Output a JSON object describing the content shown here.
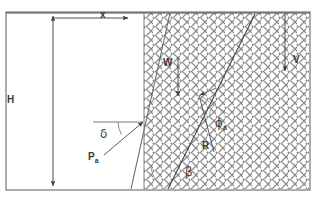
{
  "figure": {
    "width": 316,
    "height": 202,
    "background_color": "#ffffff",
    "line_color": "#4a4a4a",
    "soil_hatch_color": "#8d8d8d",
    "label_color": "#3a3a3a"
  },
  "labels": {
    "x": "x",
    "H": "H",
    "W": "W",
    "V": "V",
    "R": "R",
    "beta": "β",
    "delta": "δ",
    "phi": "ϕ",
    "phi_sub": "a",
    "Pa": "P",
    "Pa_sub": "a"
  },
  "elements": {
    "top_ground_surface": "top-ground-line",
    "wall_face": "inclined-wall-face",
    "failure_plane": "failure-wedge-plane",
    "soil_region": "hatched-backfill-soil",
    "height_dimension": "H-dimension-arrow",
    "x_dimension": "x-dimension-arrow",
    "weight_vector": "W-weight-vector",
    "surcharge_vector": "V-vertical-vector",
    "reaction_vector": "R-reaction-force",
    "normal_line": "normal-to-failure-plane",
    "active_thrust_vector": "Pa-active-thrust",
    "angle_beta": "beta-wedge-angle",
    "angle_delta": "delta-wall-friction-angle",
    "angle_phi": "phi-soil-friction-angle"
  },
  "geometry": {
    "frame": {
      "left": 6,
      "top": 12,
      "right": 310,
      "bottom": 190
    },
    "wall_top_x": 170,
    "wall_bottom_x": 131,
    "soil_left_x": 144,
    "failure_top_x": 255,
    "failure_bottom_x": 168,
    "wedge_vertex": {
      "x": 199,
      "y": 95
    }
  }
}
